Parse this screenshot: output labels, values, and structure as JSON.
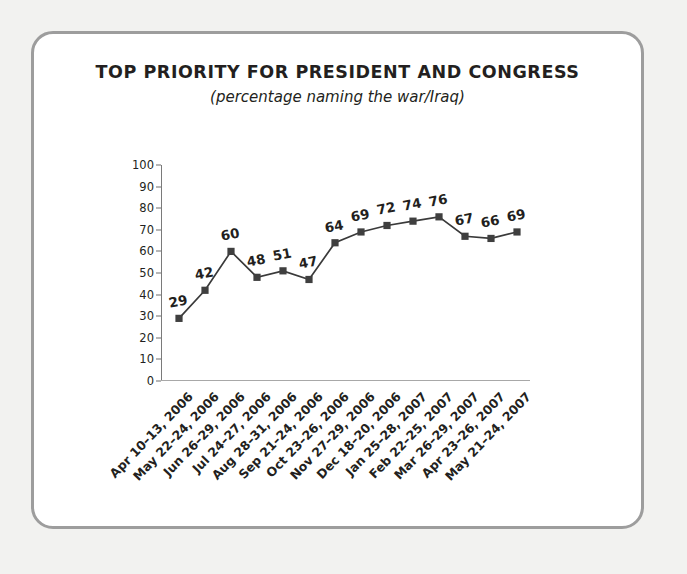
{
  "chart_data": {
    "type": "line",
    "title": "TOP PRIORITY FOR PRESIDENT AND CONGRESS",
    "subtitle": "(percentage naming the war/Iraq)",
    "xlabel": "",
    "ylabel": "",
    "ylim": [
      0,
      100
    ],
    "y_ticks": [
      0,
      10,
      20,
      30,
      40,
      50,
      60,
      70,
      80,
      90,
      100
    ],
    "grid": false,
    "legend": false,
    "marker": "square",
    "line_color": "#3a3a3a",
    "marker_color": "#3f3f3f",
    "categories": [
      "Apr 10–13, 2006",
      "May 22–24, 2006",
      "Jun 26–29, 2006",
      "Jul 24–27, 2006",
      "Aug 28–31, 2006",
      "Sep 21–24, 2006",
      "Oct 23–26, 2006",
      "Nov 27–29, 2006",
      "Dec 18–20, 2006",
      "Jan 25–28, 2007",
      "Feb 22–25, 2007",
      "Mar 26–29, 2007",
      "Apr 23–26, 2007",
      "May 21–24, 2007"
    ],
    "values": [
      29,
      42,
      60,
      48,
      51,
      47,
      64,
      69,
      72,
      74,
      76,
      67,
      66,
      69
    ],
    "point_labels": [
      "29",
      "42",
      "60",
      "48",
      "51",
      "47",
      "64",
      "69",
      "72",
      "74",
      "76",
      "67",
      "66",
      "69"
    ]
  },
  "colors": {
    "page_background": "#f2f2f0",
    "card_background": "#ffffff",
    "card_border": "#9d9d9d",
    "text": "#231f20",
    "axis": "#7a7a7a",
    "series": "#3a3a3a"
  }
}
